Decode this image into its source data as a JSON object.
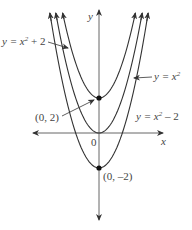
{
  "diagram": {
    "axes": {
      "x_label": "x",
      "y_label": "y",
      "origin_label": "0"
    },
    "curves": [
      {
        "name": "y = x^2 + 2",
        "label_base": "y = x",
        "label_exp": "2",
        "label_suffix": " + 2",
        "shift": 2
      },
      {
        "name": "y = x^2",
        "label_base": "y = x",
        "label_exp": "2",
        "label_suffix": "",
        "shift": 0
      },
      {
        "name": "y = x^2 - 2",
        "label_base": "y = x",
        "label_exp": "2",
        "label_suffix": " – 2",
        "shift": -2
      }
    ],
    "points": [
      {
        "label": "(0, 2)",
        "x": 0,
        "y": 2
      },
      {
        "label": "(0, –2)",
        "x": 0,
        "y": -2
      }
    ],
    "colors": {
      "curve": "#333333",
      "axis": "#555555",
      "text": "#444444"
    }
  }
}
